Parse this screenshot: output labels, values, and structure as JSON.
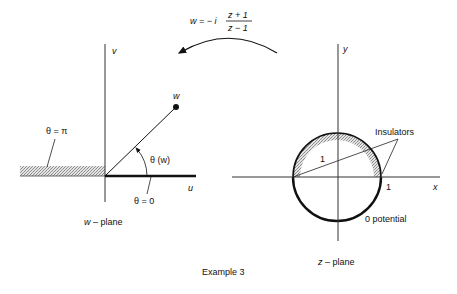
{
  "figure": {
    "caption": "Example 3",
    "mapping": {
      "lhs": "w = − i",
      "numerator": "z + 1",
      "denominator": "z − 1"
    }
  },
  "w_plane": {
    "title_var": "w",
    "title_rest": " – plane",
    "axis_h": "u",
    "axis_v": "v",
    "point_label": "w",
    "angle_label": "θ (w)",
    "theta_pi": "θ = π",
    "theta_zero": "θ = 0"
  },
  "z_plane": {
    "title_var": "z",
    "title_rest": " – plane",
    "axis_h": "x",
    "axis_v": "y",
    "radius_label": "1",
    "x_tick": "1",
    "insulators_label": "Insulators",
    "potential_label": "0 potential"
  },
  "colors": {
    "ink": "#111111",
    "hatch": "#a8a8a8",
    "background": "#ffffff"
  }
}
